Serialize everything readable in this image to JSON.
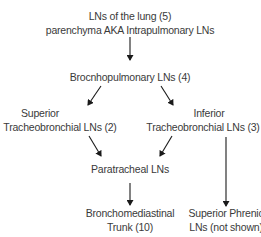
{
  "diagram": {
    "type": "flowchart",
    "nodes": [
      {
        "id": "lung",
        "lines": [
          "LNs of the lung (5)",
          "parenchyma AKA Intrapulmonary LNs"
        ]
      },
      {
        "id": "bronchopulmonary",
        "lines": [
          "Brocnhopulmonary LNs (4)"
        ]
      },
      {
        "id": "superior_tb",
        "lines": [
          "Superior",
          "Tracheobronchial LNs (2)"
        ]
      },
      {
        "id": "inferior_tb",
        "lines": [
          "Inferior",
          "Tracheobronchial LNs (3)"
        ]
      },
      {
        "id": "paratracheal",
        "lines": [
          "Paratracheal LNs"
        ]
      },
      {
        "id": "bronchomediastinal",
        "lines": [
          "Bronchomediastinal",
          "Trunk (10)"
        ]
      },
      {
        "id": "superior_phrenic",
        "lines": [
          "Superior Phrenic",
          "LNs (not shown)"
        ]
      }
    ],
    "edges": [
      {
        "from": "lung",
        "to": "bronchopulmonary"
      },
      {
        "from": "bronchopulmonary",
        "to": "superior_tb"
      },
      {
        "from": "bronchopulmonary",
        "to": "inferior_tb"
      },
      {
        "from": "superior_tb",
        "to": "paratracheal"
      },
      {
        "from": "inferior_tb",
        "to": "paratracheal"
      },
      {
        "from": "paratracheal",
        "to": "bronchomediastinal"
      },
      {
        "from": "inferior_tb",
        "to": "superior_phrenic"
      }
    ],
    "colors": {
      "text": "#3a3a3a",
      "arrow": "#1a1a1a",
      "background": "#ffffff"
    }
  }
}
